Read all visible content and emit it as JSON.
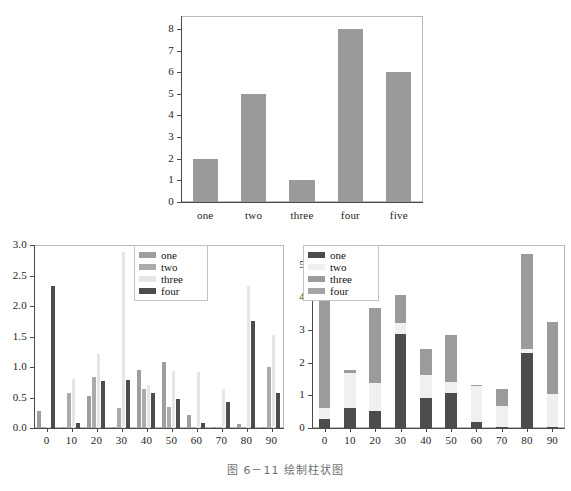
{
  "caption": "图 6－11   绘制柱状图",
  "charts": {
    "top": {
      "type": "bar",
      "title": "",
      "xlabel": "",
      "ylabel": "",
      "categories": [
        "one",
        "two",
        "three",
        "four",
        "five"
      ],
      "values": [
        2,
        5,
        1,
        8,
        6
      ],
      "yticks": [
        "0",
        "1",
        "2",
        "3",
        "4",
        "5",
        "6",
        "7",
        "8"
      ],
      "ytick_values": [
        0,
        1,
        2,
        3,
        4,
        5,
        6,
        7,
        8
      ],
      "ylim": [
        0,
        8.6
      ],
      "bar_color": "#9a9a9a",
      "grid": false,
      "legend": false
    },
    "bottom_left": {
      "type": "bar",
      "subtype": "grouped",
      "title": "",
      "xlabel": "",
      "ylabel": "",
      "categories": [
        "0",
        "10",
        "20",
        "30",
        "40",
        "50",
        "60",
        "70",
        "80",
        "90"
      ],
      "x": [
        0,
        10,
        20,
        30,
        40,
        50,
        60,
        70,
        80,
        90
      ],
      "series": [
        {
          "name": "one",
          "color": "#9e9e9e",
          "values": [
            0.28,
            0.02,
            0.53,
            0.01,
            0.95,
            1.08,
            0.22,
            0.02,
            0.07,
            0.02
          ]
        },
        {
          "name": "two",
          "color": "#ababab",
          "values": [
            0.01,
            0.58,
            0.83,
            0.33,
            0.64,
            0.34,
            0.01,
            0.01,
            0.01,
            1.0
          ]
        },
        {
          "name": "three",
          "color": "#e6e6e6",
          "values": [
            0.02,
            0.81,
            1.21,
            2.88,
            0.71,
            0.93,
            0.92,
            0.64,
            2.32,
            1.53
          ]
        },
        {
          "name": "four",
          "color": "#4c4c4c",
          "values": [
            2.33,
            0.08,
            0.77,
            0.79,
            0.58,
            0.47,
            0.09,
            0.42,
            1.76,
            0.58
          ]
        }
      ],
      "yticks": [
        "0.0",
        "0.5",
        "1.0",
        "1.5",
        "2.0",
        "2.5",
        "3.0"
      ],
      "ytick_values": [
        0.0,
        0.5,
        1.0,
        1.5,
        2.0,
        2.5,
        3.0
      ],
      "ylim": [
        0,
        3.0
      ],
      "grid": false,
      "legend": true,
      "legend_position": "top-center"
    },
    "bottom_right": {
      "type": "bar",
      "subtype": "stacked",
      "title": "",
      "xlabel": "",
      "ylabel": "",
      "categories": [
        "0",
        "10",
        "20",
        "30",
        "40",
        "50",
        "60",
        "70",
        "80",
        "90"
      ],
      "x": [
        0,
        10,
        20,
        30,
        40,
        50,
        60,
        70,
        80,
        90
      ],
      "series": [
        {
          "name": "one",
          "color": "#4c4c4c",
          "values": [
            0.28,
            0.6,
            0.53,
            2.87,
            0.93,
            1.07,
            0.19,
            0.02,
            2.29,
            0.03
          ]
        },
        {
          "name": "two",
          "color": "#f0f0f0",
          "values": [
            0.32,
            1.08,
            0.86,
            0.34,
            0.7,
            0.35,
            1.08,
            0.64,
            0.12,
            1.0
          ]
        },
        {
          "name": "three",
          "color": "#9b9b9b",
          "values": [
            3.48,
            0.08,
            2.27,
            0.86,
            0.78,
            1.44,
            0.06,
            0.52,
            2.92,
            2.2
          ]
        },
        {
          "name": "four",
          "color": "#a4a4a4",
          "values": [
            0.0,
            0.0,
            0.0,
            0.0,
            0.0,
            0.0,
            0.0,
            0.0,
            0.0,
            0.0
          ]
        }
      ],
      "totals": [
        4.08,
        1.76,
        3.66,
        4.07,
        2.41,
        2.86,
        1.33,
        1.18,
        5.33,
        3.23
      ],
      "yticks": [
        "0",
        "1",
        "2",
        "3",
        "4",
        "5"
      ],
      "ytick_values": [
        0,
        1,
        2,
        3,
        4,
        5
      ],
      "ylim": [
        0,
        5.6
      ],
      "grid": false,
      "legend": true,
      "legend_position": "top-left"
    }
  },
  "legends": {
    "bottom_left": [
      {
        "label": "one",
        "color": "#9e9e9e"
      },
      {
        "label": "two",
        "color": "#ababab"
      },
      {
        "label": "three",
        "color": "#e6e6e6"
      },
      {
        "label": "four",
        "color": "#4c4c4c"
      }
    ],
    "bottom_right": [
      {
        "label": "one",
        "color": "#4c4c4c"
      },
      {
        "label": "two",
        "color": "#f0f0f0"
      },
      {
        "label": "three",
        "color": "#9b9b9b"
      },
      {
        "label": "four",
        "color": "#a4a4a4"
      }
    ]
  }
}
